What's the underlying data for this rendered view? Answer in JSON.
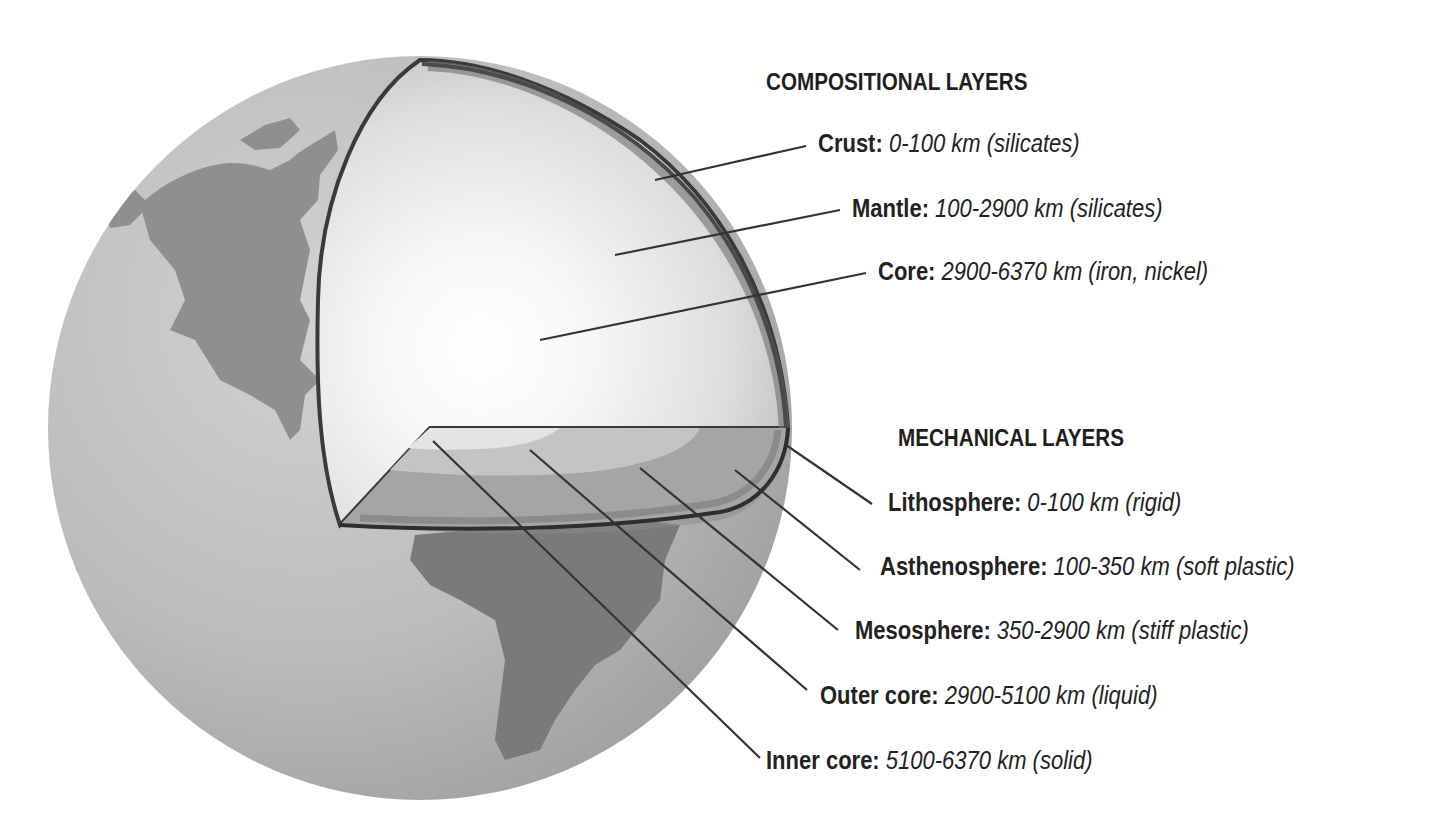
{
  "compositional": {
    "heading": "COMPOSITIONAL LAYERS",
    "layers": [
      {
        "name": "Crust:",
        "desc": "0-100 km (silicates)"
      },
      {
        "name": "Mantle:",
        "desc": "100-2900 km (silicates)"
      },
      {
        "name": "Core:",
        "desc": "2900-6370 km (iron, nickel)"
      }
    ]
  },
  "mechanical": {
    "heading": "MECHANICAL LAYERS",
    "layers": [
      {
        "name": "Lithosphere:",
        "desc": "0-100 km (rigid)"
      },
      {
        "name": "Asthenosphere:",
        "desc": "100-350 km (soft plastic)"
      },
      {
        "name": "Mesosphere:",
        "desc": "350-2900 km (stiff plastic)"
      },
      {
        "name": "Outer core:",
        "desc": "2900-5100 km (liquid)"
      },
      {
        "name": "Inner core:",
        "desc": "5100-6370 km (solid)"
      }
    ]
  },
  "colors": {
    "ocean": "#b9b9b9",
    "land": "#8f8f8f",
    "crust_band": "#6f6f6f",
    "mantle": "#d8d8d8",
    "core_glow": "#ffffff",
    "leader_line": "#333333"
  }
}
